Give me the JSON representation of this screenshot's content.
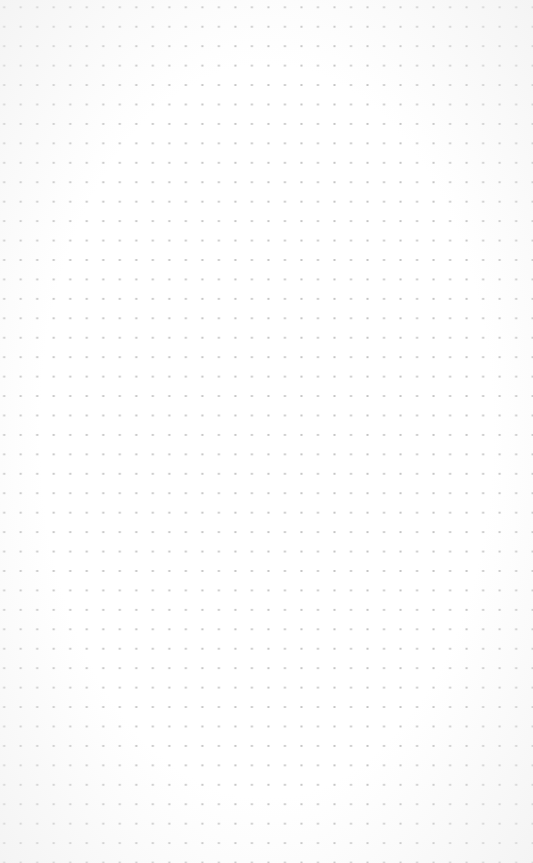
{
  "page": {
    "type": "dot-grid-paper",
    "background_color": "#ffffff",
    "dot_color": "#c4c4c4",
    "grid": {
      "columns": 31,
      "rows": 44,
      "spacing_x_px": 16.53,
      "spacing_y_px": 19.45
    }
  }
}
